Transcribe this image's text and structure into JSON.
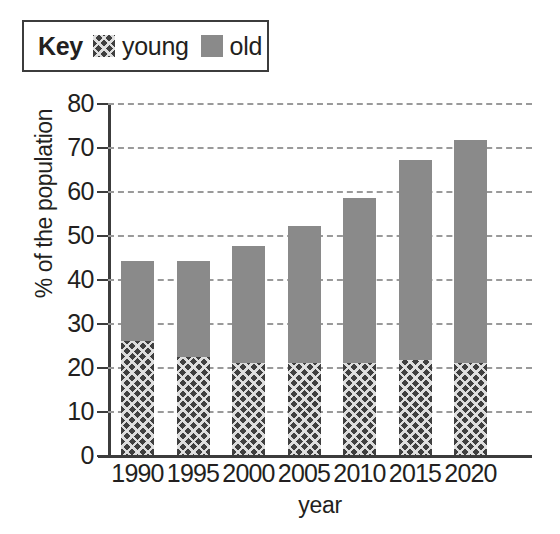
{
  "legend": {
    "title": "Key",
    "entries": [
      {
        "label": "young",
        "swatch": "hatched-swatch",
        "color": "#3f3f3f"
      },
      {
        "label": "old",
        "swatch": "solid-gray-swatch",
        "color": "#8a8a8a"
      }
    ]
  },
  "chart_data": {
    "type": "bar",
    "stacked": true,
    "title": "",
    "xlabel": "year",
    "ylabel": "% of the population",
    "categories": [
      "1990",
      "1995",
      "2000",
      "2005",
      "2010",
      "2015",
      "2020"
    ],
    "series": [
      {
        "name": "young",
        "color": "#3f3f3f",
        "values": [
          26,
          22.2,
          21,
          21,
          21,
          21.5,
          21
        ]
      },
      {
        "name": "old",
        "color": "#8a8a8a",
        "values": [
          18,
          21.8,
          26.5,
          31,
          37.5,
          45.5,
          50.5
        ]
      }
    ],
    "totals": [
      44,
      44,
      47.5,
      52,
      58.5,
      67,
      71.5
    ],
    "ylim": [
      0,
      80
    ],
    "yticks": [
      0,
      10,
      20,
      30,
      40,
      50,
      60,
      70,
      80
    ],
    "ytick_labels": [
      "0",
      "10",
      "20",
      "30",
      "40",
      "50",
      "60",
      "70",
      "80"
    ],
    "grid": true,
    "grid_style": "dashed-horizontal",
    "legend_position": "above-top-left"
  }
}
